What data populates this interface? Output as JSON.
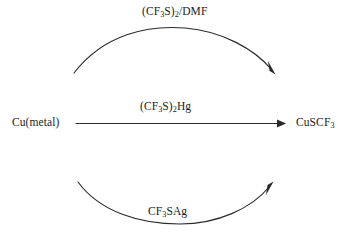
{
  "diagram": {
    "type": "chemical-reaction-scheme",
    "background_color": "#ffffff",
    "stroke_color": "#2a2a2a",
    "text_color": "#1c1c1c",
    "reactant": {
      "label": "Cu(metal)",
      "formula_parts": [
        {
          "text": "Cu(metal)",
          "sub": ""
        }
      ]
    },
    "product": {
      "label": "CuSCF3",
      "formula_parts": [
        {
          "text": "CuSCF",
          "sub": "3"
        }
      ]
    },
    "arrows": [
      {
        "id": "top-arrow",
        "shape": "curved-arc-up",
        "direction": "left-to-right",
        "reagent": "(CF3S)2/DMF",
        "reagent_parts": [
          {
            "text": "(CF",
            "sub": "3"
          },
          {
            "text": "S)",
            "sub": "2"
          },
          {
            "text": "/DMF",
            "sub": ""
          }
        ],
        "label_position": "above-arc"
      },
      {
        "id": "middle-arrow",
        "shape": "straight",
        "direction": "left-to-right",
        "reagent": "(CF3S)2Hg",
        "reagent_parts": [
          {
            "text": "(CF",
            "sub": "3"
          },
          {
            "text": "S)",
            "sub": "2"
          },
          {
            "text": "Hg",
            "sub": ""
          }
        ],
        "label_position": "above-line"
      },
      {
        "id": "bottom-arrow",
        "shape": "curved-arc-down",
        "direction": "left-to-right",
        "reagent": "CF3SAg",
        "reagent_parts": [
          {
            "text": "CF",
            "sub": "3"
          },
          {
            "text": "SAg",
            "sub": ""
          }
        ],
        "label_position": "inside-arc"
      }
    ]
  }
}
